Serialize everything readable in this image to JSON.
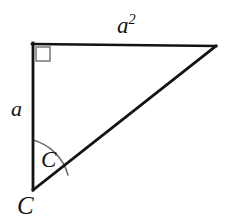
{
  "figure": {
    "type": "right-triangle-diagram",
    "background_color": "#ffffff",
    "stroke_color": "#131313",
    "marker_color": "#8d8d8d",
    "arc_color": "#6f6f6f",
    "width": 227,
    "height": 222,
    "vertices": {
      "top_left": {
        "x": 33,
        "y": 44,
        "label": "right-angle-vertex"
      },
      "top_right": {
        "x": 216,
        "y": 46,
        "label": "apex-vertex"
      },
      "bottom_left": {
        "x": 33,
        "y": 190,
        "label": "labeled-vertex-C"
      }
    },
    "edges": {
      "top": {
        "from": "top_left",
        "to": "top_right",
        "label": "a2"
      },
      "left": {
        "from": "top_left",
        "to": "bottom_left",
        "label": "a"
      },
      "hypotenuse": {
        "from": "bottom_left",
        "to": "top_right",
        "label": ""
      }
    },
    "right_angle_marker": {
      "at": "top_left",
      "size": 14,
      "shape": "square"
    },
    "angle_arc": {
      "at": "bottom_left",
      "radius": 50,
      "label": "C"
    }
  },
  "labels": {
    "top_edge_base": "a",
    "top_edge_exponent": "2",
    "left_edge": "a",
    "angle_inner": "C",
    "vertex_bottom": "C"
  }
}
